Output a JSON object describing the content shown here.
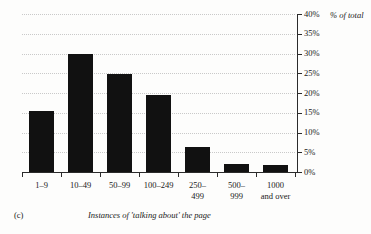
{
  "chart_data": {
    "type": "bar",
    "title": "",
    "subtitle": "",
    "xlabel": "Instances of 'talking about' the page",
    "ylabel": "% of total",
    "ylim": [
      0,
      40
    ],
    "ytick_values": [
      0,
      5,
      10,
      15,
      20,
      25,
      30,
      35,
      40
    ],
    "ytick_labels": [
      "0%",
      "5%",
      "10%",
      "15%",
      "20%",
      "25%",
      "30%",
      "35%",
      "40%"
    ],
    "yaxis_position": "right",
    "grid": "horizontal-dotted",
    "legend": "none",
    "bar_color": "#111111",
    "categories": [
      "1–9",
      "10–49",
      "50–99",
      "100–249",
      "250–499",
      "500–999",
      "1000 and over"
    ],
    "category_lines": [
      [
        "1–9"
      ],
      [
        "10–49"
      ],
      [
        "50–99"
      ],
      [
        "100–249"
      ],
      [
        "250–",
        "499"
      ],
      [
        "500–",
        "999"
      ],
      [
        "1000",
        "and over"
      ]
    ],
    "values": [
      15.5,
      30.0,
      24.7,
      19.5,
      6.3,
      2.1,
      1.7
    ]
  },
  "caption": {
    "panel_label": "(c)",
    "text": "Instances of 'talking about' the page"
  }
}
